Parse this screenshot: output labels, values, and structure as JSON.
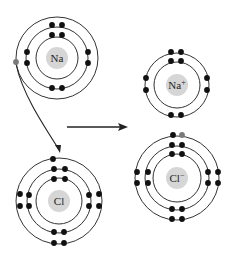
{
  "diagram": {
    "title": "",
    "colors": {
      "shell": "#333333",
      "electron": "#111111",
      "transferred_electron": "#7a7a7a",
      "nucleus": "#d6d6d6",
      "arrow": "#222222",
      "label": "#222222"
    },
    "atoms": [
      {
        "id": "na",
        "label": "Na",
        "superscript": "",
        "center": [
          57,
          58
        ],
        "nucleus_r": 11,
        "shells": [
          21,
          31,
          41
        ],
        "electrons": [
          {
            "x": 52,
            "y": 35,
            "fill": "electron"
          },
          {
            "x": 62,
            "y": 35,
            "fill": "electron"
          },
          {
            "x": 52,
            "y": 25,
            "fill": "electron"
          },
          {
            "x": 62,
            "y": 25,
            "fill": "electron"
          },
          {
            "x": 27,
            "y": 52,
            "fill": "electron"
          },
          {
            "x": 27,
            "y": 63,
            "fill": "electron"
          },
          {
            "x": 88,
            "y": 52,
            "fill": "electron"
          },
          {
            "x": 88,
            "y": 63,
            "fill": "electron"
          },
          {
            "x": 52,
            "y": 88,
            "fill": "electron"
          },
          {
            "x": 62,
            "y": 88,
            "fill": "electron"
          },
          {
            "x": 16,
            "y": 62,
            "fill": "transferred_electron"
          }
        ]
      },
      {
        "id": "cl",
        "label": "Cl",
        "superscript": "",
        "center": [
          59,
          201
        ],
        "nucleus_r": 11,
        "shells": [
          23,
          32,
          43
        ],
        "electrons": [
          {
            "x": 54,
            "y": 179,
            "fill": "electron"
          },
          {
            "x": 65,
            "y": 179,
            "fill": "electron"
          },
          {
            "x": 54,
            "y": 169,
            "fill": "electron"
          },
          {
            "x": 65,
            "y": 169,
            "fill": "electron"
          },
          {
            "x": 29,
            "y": 195,
            "fill": "electron"
          },
          {
            "x": 29,
            "y": 206,
            "fill": "electron"
          },
          {
            "x": 89,
            "y": 195,
            "fill": "electron"
          },
          {
            "x": 89,
            "y": 206,
            "fill": "electron"
          },
          {
            "x": 54,
            "y": 232,
            "fill": "electron"
          },
          {
            "x": 64,
            "y": 232,
            "fill": "electron"
          },
          {
            "x": 53,
            "y": 159,
            "fill": "electron"
          },
          {
            "x": 20,
            "y": 194,
            "fill": "electron"
          },
          {
            "x": 20,
            "y": 206,
            "fill": "electron"
          },
          {
            "x": 99,
            "y": 194,
            "fill": "electron"
          },
          {
            "x": 99,
            "y": 206,
            "fill": "electron"
          },
          {
            "x": 54,
            "y": 243,
            "fill": "electron"
          },
          {
            "x": 64,
            "y": 243,
            "fill": "electron"
          }
        ]
      },
      {
        "id": "na-ion",
        "label": "Na",
        "superscript": "+",
        "center": [
          177,
          85
        ],
        "nucleus_r": 11,
        "shells": [
          23,
          32
        ],
        "electrons": [
          {
            "x": 171,
            "y": 61,
            "fill": "electron"
          },
          {
            "x": 181,
            "y": 61,
            "fill": "electron"
          },
          {
            "x": 171,
            "y": 52,
            "fill": "electron"
          },
          {
            "x": 181,
            "y": 52,
            "fill": "electron"
          },
          {
            "x": 146,
            "y": 78,
            "fill": "electron"
          },
          {
            "x": 146,
            "y": 90,
            "fill": "electron"
          },
          {
            "x": 207,
            "y": 78,
            "fill": "electron"
          },
          {
            "x": 207,
            "y": 90,
            "fill": "electron"
          },
          {
            "x": 171,
            "y": 115,
            "fill": "electron"
          },
          {
            "x": 181,
            "y": 115,
            "fill": "electron"
          }
        ]
      },
      {
        "id": "cl-ion",
        "label": "Cl",
        "superscript": "−",
        "center": [
          177,
          178
        ],
        "nucleus_r": 11,
        "shells": [
          24,
          32,
          42
        ],
        "electrons": [
          {
            "x": 172,
            "y": 154,
            "fill": "electron"
          },
          {
            "x": 182,
            "y": 154,
            "fill": "electron"
          },
          {
            "x": 172,
            "y": 145,
            "fill": "electron"
          },
          {
            "x": 182,
            "y": 145,
            "fill": "electron"
          },
          {
            "x": 148,
            "y": 172,
            "fill": "electron"
          },
          {
            "x": 148,
            "y": 183,
            "fill": "electron"
          },
          {
            "x": 208,
            "y": 172,
            "fill": "electron"
          },
          {
            "x": 208,
            "y": 183,
            "fill": "electron"
          },
          {
            "x": 172,
            "y": 209,
            "fill": "electron"
          },
          {
            "x": 182,
            "y": 209,
            "fill": "electron"
          },
          {
            "x": 173,
            "y": 135,
            "fill": "electron"
          },
          {
            "x": 182,
            "y": 135,
            "fill": "transferred_electron"
          },
          {
            "x": 137,
            "y": 172,
            "fill": "electron"
          },
          {
            "x": 137,
            "y": 183,
            "fill": "electron"
          },
          {
            "x": 218,
            "y": 172,
            "fill": "electron"
          },
          {
            "x": 218,
            "y": 183,
            "fill": "electron"
          },
          {
            "x": 172,
            "y": 219,
            "fill": "electron"
          },
          {
            "x": 182,
            "y": 219,
            "fill": "electron"
          }
        ]
      }
    ],
    "arrows": {
      "transfer": {
        "path": "M16,64 C22,92 40,120 58,148",
        "head": [
          60,
          153
        ]
      },
      "reaction": {
        "from": [
          67,
          127
        ],
        "to": [
          128,
          127
        ]
      }
    }
  }
}
